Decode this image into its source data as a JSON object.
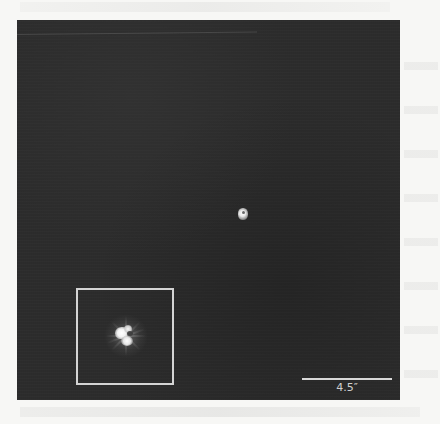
{
  "figure": {
    "type": "astronomical-image",
    "background_color": "#2c2c2c",
    "page_background_color": "#f7f7f5",
    "sources": [
      {
        "name": "compact-source",
        "position_px": [
          243,
          213
        ],
        "approx_size_px": 10,
        "color": "#ffffff"
      }
    ],
    "inset": {
      "frame_color": "#d4d4d4",
      "frame_bounds_px": {
        "x": 76,
        "y": 288,
        "width": 98,
        "height": 97
      },
      "content": "zoomed view of compact source with diffraction-like radial spikes",
      "source_center_px": [
        122,
        332
      ]
    },
    "scale_bar": {
      "label": "4.5″",
      "length_px": 90,
      "color": "#d8d8d8"
    }
  }
}
